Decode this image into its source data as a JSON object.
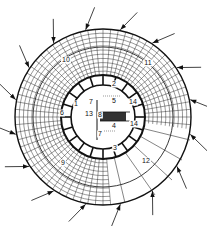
{
  "diagram": {
    "type": "circular-building-floor-plan",
    "center": {
      "x": 103,
      "y": 117
    },
    "outer_radius": 88,
    "middle_radius": 70,
    "inner_ring_outer_radius": 42,
    "inner_ring_inner_radius": 32,
    "arrow_count": 16,
    "colors": {
      "ink": "#111111",
      "grid": "#333333",
      "paper": "#ffffff"
    },
    "labels": [
      {
        "id": "1",
        "text": "1",
        "x": 76,
        "y": 106
      },
      {
        "id": "2",
        "text": "2",
        "x": 114,
        "y": 86
      },
      {
        "id": "3",
        "text": "3",
        "x": 115,
        "y": 150
      },
      {
        "id": "4",
        "text": "4",
        "x": 114,
        "y": 128
      },
      {
        "id": "5",
        "text": "5",
        "x": 114,
        "y": 103
      },
      {
        "id": "6",
        "text": "6",
        "x": 62,
        "y": 115
      },
      {
        "id": "7a",
        "text": "7",
        "x": 91,
        "y": 104
      },
      {
        "id": "7b",
        "text": "7",
        "x": 100,
        "y": 136
      },
      {
        "id": "8",
        "text": "8",
        "x": 100,
        "y": 117
      },
      {
        "id": "9",
        "text": "9",
        "x": 63,
        "y": 165
      },
      {
        "id": "10",
        "text": "10",
        "x": 66,
        "y": 62
      },
      {
        "id": "11",
        "text": "11",
        "x": 148,
        "y": 65
      },
      {
        "id": "12",
        "text": "12",
        "x": 146,
        "y": 163
      },
      {
        "id": "13",
        "text": "13",
        "x": 89,
        "y": 116
      },
      {
        "id": "14a",
        "text": "14",
        "x": 133,
        "y": 104
      },
      {
        "id": "14b",
        "text": "14",
        "x": 134,
        "y": 126
      }
    ]
  }
}
